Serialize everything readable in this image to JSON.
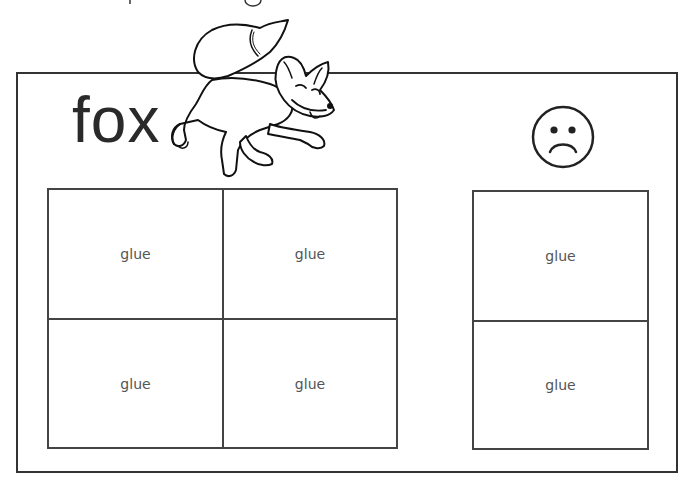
{
  "worksheet": {
    "word": "fox",
    "illustration": "fox-drawing",
    "emotion_icon": "sad-face-icon",
    "left_grid": {
      "rows": 2,
      "cols": 2,
      "cells": [
        {
          "label": "glue"
        },
        {
          "label": "glue"
        },
        {
          "label": "glue"
        },
        {
          "label": "glue"
        }
      ]
    },
    "right_grid": {
      "rows": 2,
      "cols": 1,
      "cells": [
        {
          "label": "glue"
        },
        {
          "label": "glue"
        }
      ]
    }
  },
  "colors": {
    "line": "#333333",
    "label": "#555555",
    "background": "#ffffff"
  }
}
